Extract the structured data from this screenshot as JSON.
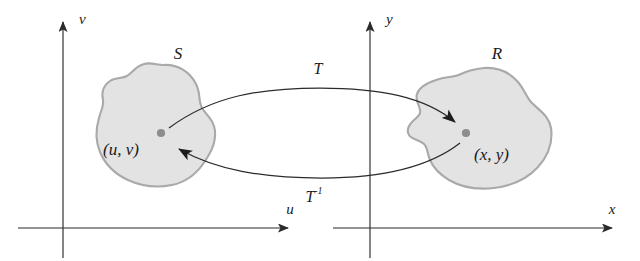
{
  "figure": {
    "kind": "math-diagram",
    "background_color": "#ffffff"
  },
  "colors": {
    "ink": "#2b2b2b",
    "label_ink": "#1a1a1a",
    "region_fill": "#e3e3e3",
    "region_stroke": "#a9a9a9",
    "point_dot": "#8d8d8d",
    "arrow": "#2b2b2b"
  },
  "planes": [
    {
      "id": "uv-plane",
      "vertical_axis_label": "v",
      "horizontal_axis_label": "u",
      "region": {
        "label": "S",
        "point_label": "(u, v)"
      }
    },
    {
      "id": "xy-plane",
      "vertical_axis_label": "y",
      "horizontal_axis_label": "x",
      "region": {
        "label": "R",
        "point_label": "(x, y)"
      }
    }
  ],
  "mappings": [
    {
      "id": "forward",
      "label": "T",
      "superscript": "",
      "direction": "uv-to-xy"
    },
    {
      "id": "inverse",
      "label": "T",
      "superscript": "-1",
      "direction": "xy-to-uv"
    }
  ]
}
